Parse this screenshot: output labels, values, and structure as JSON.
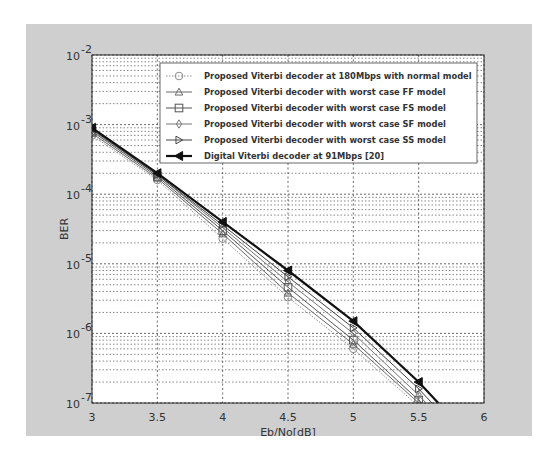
{
  "chart_data": {
    "type": "line",
    "title": "",
    "xlabel": "Eb/No[dB]",
    "ylabel": "BER",
    "xscale": "linear",
    "yscale": "log",
    "xlim": [
      3,
      6
    ],
    "ylim": [
      1e-07,
      0.01
    ],
    "grid": true,
    "legend_position": "upper right",
    "x_ticks": [
      3,
      3.5,
      4,
      4.5,
      5,
      5.5,
      6
    ],
    "x_tick_labels": [
      "3",
      "3.5",
      "4",
      "4.5",
      "5",
      "5.5",
      "6"
    ],
    "y_ticks": [
      1e-07,
      1e-06,
      1e-05,
      0.0001,
      0.001,
      0.01
    ],
    "y_tick_labels": [
      {
        "base": "10",
        "exp": "-7"
      },
      {
        "base": "10",
        "exp": "-6"
      },
      {
        "base": "10",
        "exp": "-5"
      },
      {
        "base": "10",
        "exp": "-4"
      },
      {
        "base": "10",
        "exp": "-3"
      },
      {
        "base": "10",
        "exp": "-2"
      }
    ],
    "x": [
      3,
      3.5,
      4,
      4.5,
      5,
      5.5
    ],
    "series": [
      {
        "name": "Proposed Viterbi decoder at 180Mbps with normal model",
        "marker": "circle",
        "line": "dotted",
        "color": "#8a8a8a",
        "values": [
          0.0007,
          0.00016,
          2.3e-05,
          3.3e-06,
          6e-07,
          9e-08
        ]
      },
      {
        "name": "Proposed Viterbi decoder with worst case FF model",
        "marker": "triangle-up",
        "line": "solid",
        "color": "#6a6a6a",
        "values": [
          0.00075,
          0.00017,
          2.7e-05,
          3.8e-06,
          7e-07,
          1e-07
        ]
      },
      {
        "name": "Proposed Viterbi decoder with worst case FS model",
        "marker": "square",
        "line": "solid",
        "color": "#555555",
        "values": [
          0.0008,
          0.00018,
          3e-05,
          4.6e-06,
          8e-07,
          1.1e-07
        ]
      },
      {
        "name": "Proposed Viterbi decoder with worst case SF model",
        "marker": "diamond",
        "line": "solid",
        "color": "#777777",
        "values": [
          0.00083,
          0.00019,
          3.3e-05,
          5.5e-06,
          1e-06,
          1.3e-07
        ]
      },
      {
        "name": "Proposed Viterbi decoder with worst case SS model",
        "marker": "triangle-right",
        "line": "solid",
        "color": "#444444",
        "values": [
          0.00086,
          0.00019,
          3.6e-05,
          6.5e-06,
          1.2e-06,
          1.6e-07
        ]
      },
      {
        "name": "Digital Viterbi decoder at 91Mbps [20]",
        "marker": "triangle-left-filled",
        "line": "solid-thick",
        "color": "#111111",
        "values": [
          0.0009,
          0.0002,
          4e-05,
          8e-06,
          1.5e-06,
          2e-07
        ]
      }
    ]
  }
}
